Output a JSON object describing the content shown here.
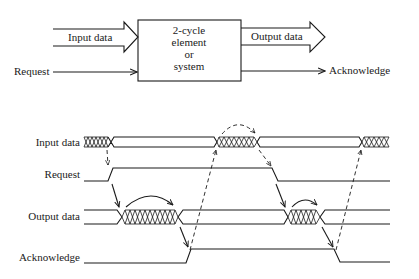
{
  "block_diagram": {
    "box_label_lines": [
      "2-cycle",
      "element",
      "or",
      "system"
    ],
    "inputs": [
      {
        "label": "Input data",
        "kind": "bus-arrow"
      },
      {
        "label": "Request",
        "kind": "line-arrow"
      }
    ],
    "outputs": [
      {
        "label": "Output data",
        "kind": "bus-arrow"
      },
      {
        "label": "Acknowledge",
        "kind": "line-arrow"
      }
    ]
  },
  "timing_diagram": {
    "signals": [
      {
        "name": "Input data",
        "type": "bus"
      },
      {
        "name": "Request",
        "type": "wire"
      },
      {
        "name": "Output data",
        "type": "bus"
      },
      {
        "name": "Acknowledge",
        "type": "wire"
      }
    ]
  },
  "colors": {
    "ink": "#1a1a1a",
    "background": "#ffffff"
  }
}
